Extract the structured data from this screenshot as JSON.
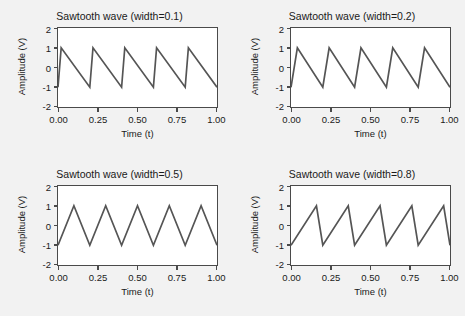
{
  "figure": {
    "background_color": "#fdfdfd",
    "band_color": "#f2f2f2",
    "line_color": "#555555",
    "axis_color": "#4a4a4a",
    "plot_background": "#ffffff"
  },
  "chart_data": [
    {
      "type": "line",
      "title": "Sawtooth wave (width=0.1)",
      "xlabel": "Time (t)",
      "ylabel": "Amplitude (V)",
      "xlim": [
        0.0,
        1.0
      ],
      "ylim": [
        -2,
        2
      ],
      "xticks": [
        0.0,
        0.25,
        0.5,
        0.75,
        1.0
      ],
      "xticklabels": [
        "0.00",
        "0.25",
        "0.50",
        "0.75",
        "1.00"
      ],
      "yticks": [
        -2,
        -1,
        0,
        1,
        2
      ],
      "yticklabels": [
        "-2",
        "-1",
        "0",
        "1",
        "2"
      ],
      "grid": false,
      "legend": null,
      "width_param": 0.1,
      "period": 0.2,
      "cycles": 5,
      "amplitude": 1,
      "peak_positions": [
        0.02,
        0.22,
        0.42,
        0.62,
        0.82
      ],
      "series": [
        {
          "name": "sawtooth width=0.1",
          "x": [
            0.0,
            0.02,
            0.2,
            0.22,
            0.4,
            0.42,
            0.6,
            0.62,
            0.8,
            0.82,
            1.0
          ],
          "y": [
            -1,
            1,
            -1,
            1,
            -1,
            1,
            -1,
            1,
            -1,
            1,
            -1
          ]
        }
      ]
    },
    {
      "type": "line",
      "title": "Sawtooth wave (width=0.2)",
      "xlabel": "Time (t)",
      "ylabel": "Amplitude (V)",
      "xlim": [
        0.0,
        1.0
      ],
      "ylim": [
        -2,
        2
      ],
      "xticks": [
        0.0,
        0.25,
        0.5,
        0.75,
        1.0
      ],
      "xticklabels": [
        "0.00",
        "0.25",
        "0.50",
        "0.75",
        "1.00"
      ],
      "yticks": [
        -2,
        -1,
        0,
        1,
        2
      ],
      "yticklabels": [
        "-2",
        "-1",
        "0",
        "1",
        "2"
      ],
      "grid": false,
      "legend": null,
      "width_param": 0.2,
      "period": 0.2,
      "cycles": 5,
      "amplitude": 1,
      "peak_positions": [
        0.04,
        0.24,
        0.44,
        0.64,
        0.84
      ],
      "series": [
        {
          "name": "sawtooth width=0.2",
          "x": [
            0.0,
            0.04,
            0.2,
            0.24,
            0.4,
            0.44,
            0.6,
            0.64,
            0.8,
            0.84,
            1.0
          ],
          "y": [
            -1,
            1,
            -1,
            1,
            -1,
            1,
            -1,
            1,
            -1,
            1,
            -1
          ]
        }
      ]
    },
    {
      "type": "line",
      "title": "Sawtooth wave (width=0.5)",
      "xlabel": "Time (t)",
      "ylabel": "Amplitude (V)",
      "xlim": [
        0.0,
        1.0
      ],
      "ylim": [
        -2,
        2
      ],
      "xticks": [
        0.0,
        0.25,
        0.5,
        0.75,
        1.0
      ],
      "xticklabels": [
        "0.00",
        "0.25",
        "0.50",
        "0.75",
        "1.00"
      ],
      "yticks": [
        -2,
        -1,
        0,
        1,
        2
      ],
      "yticklabels": [
        "-2",
        "-1",
        "0",
        "1",
        "2"
      ],
      "grid": false,
      "legend": null,
      "width_param": 0.5,
      "period": 0.2,
      "cycles": 5,
      "amplitude": 1,
      "peak_positions": [
        0.1,
        0.3,
        0.5,
        0.7,
        0.9
      ],
      "series": [
        {
          "name": "sawtooth width=0.5",
          "x": [
            0.0,
            0.1,
            0.2,
            0.3,
            0.4,
            0.5,
            0.6,
            0.7,
            0.8,
            0.9,
            1.0
          ],
          "y": [
            -1,
            1,
            -1,
            1,
            -1,
            1,
            -1,
            1,
            -1,
            1,
            -1
          ]
        }
      ]
    },
    {
      "type": "line",
      "title": "Sawtooth wave (width=0.8)",
      "xlabel": "Time (t)",
      "ylabel": "Amplitude (V)",
      "xlim": [
        0.0,
        1.0
      ],
      "ylim": [
        -2,
        2
      ],
      "xticks": [
        0.0,
        0.25,
        0.5,
        0.75,
        1.0
      ],
      "xticklabels": [
        "0.00",
        "0.25",
        "0.50",
        "0.75",
        "1.00"
      ],
      "yticks": [
        -2,
        -1,
        0,
        1,
        2
      ],
      "yticklabels": [
        "-2",
        "-1",
        "0",
        "1",
        "2"
      ],
      "grid": false,
      "legend": null,
      "width_param": 0.8,
      "period": 0.2,
      "cycles": 5,
      "amplitude": 1,
      "peak_positions": [
        0.16,
        0.36,
        0.56,
        0.76,
        0.96
      ],
      "series": [
        {
          "name": "sawtooth width=0.8",
          "x": [
            0.0,
            0.16,
            0.2,
            0.36,
            0.4,
            0.56,
            0.6,
            0.76,
            0.8,
            0.96,
            1.0
          ],
          "y": [
            -1,
            1,
            -1,
            1,
            -1,
            1,
            -1,
            1,
            -1,
            1,
            -1
          ]
        }
      ]
    }
  ]
}
